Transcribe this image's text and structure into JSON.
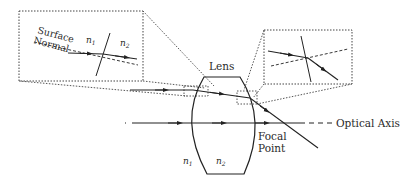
{
  "diagram": {
    "type": "lens refraction diagram",
    "labels": {
      "lens": "Lens",
      "optical_axis": "Optical Axis",
      "focal_point_line1": "Focal",
      "focal_point_line2": "Point",
      "surface_normal_line1": "Surface",
      "surface_normal_line2": "Normal",
      "n1": "n",
      "n1_sub": "1",
      "n2": "n",
      "n2_sub": "2"
    },
    "insets": [
      {
        "id": "left-inset",
        "description": "magnified refraction at first lens surface",
        "labels": [
          "Surface Normal",
          "n1",
          "n2"
        ]
      },
      {
        "id": "right-inset",
        "description": "magnified refraction at second lens surface"
      }
    ],
    "colors": {
      "line": "#222222",
      "dotted": "#444444",
      "background": "#ffffff"
    }
  }
}
